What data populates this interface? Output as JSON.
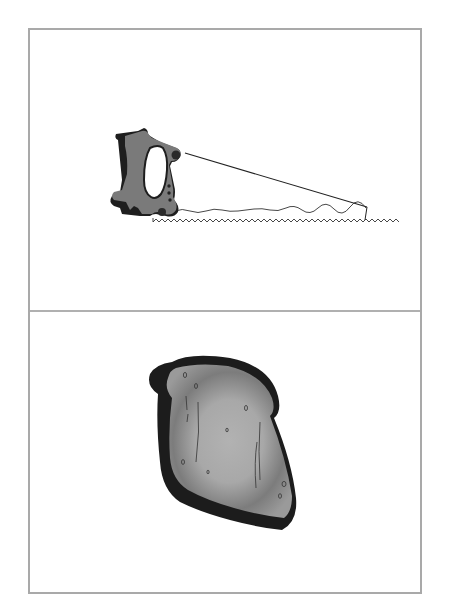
{
  "card": {
    "panels": [
      {
        "id": "top",
        "subject": "hand saw",
        "icon": "saw-icon",
        "colors": {
          "handle": "#7a7a7a",
          "handle_shadow": "#1e1e1e",
          "blade_line": "#222222"
        }
      },
      {
        "id": "bottom",
        "subject": "slice of toast",
        "icon": "bread-slice-icon",
        "colors": {
          "crumb": "#a8a8a8",
          "crumb_shade": "#6e6e6e",
          "crust": "#1c1c1c"
        }
      }
    ],
    "border_color": "#a9a9a9"
  }
}
